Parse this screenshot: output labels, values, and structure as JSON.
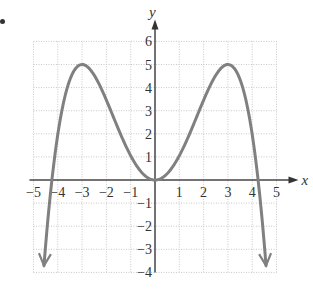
{
  "chart_data": {
    "type": "line",
    "title": "",
    "xlabel": "x",
    "ylabel": "y",
    "xlim": [
      -5,
      5
    ],
    "ylim": [
      -4,
      6
    ],
    "grid": true,
    "x_ticks": [
      -5,
      -4,
      -3,
      -2,
      -1,
      1,
      2,
      3,
      4,
      5
    ],
    "x_tick_labels": [
      "−5",
      "−4",
      "−3",
      "−2",
      "−1",
      "1",
      "2",
      "3",
      "4",
      "5"
    ],
    "y_ticks": [
      6,
      5,
      4,
      3,
      2,
      1,
      -1,
      -2,
      -3,
      -4
    ],
    "y_tick_labels": [
      "6",
      "5",
      "4",
      "3",
      "2",
      "1",
      "−1",
      "−2",
      "−3",
      "−4"
    ],
    "series": [
      {
        "name": "polynomial curve",
        "color": "#808080",
        "description": "Even quartic with local maxima at (-3,5) and (3,5), local minimum at (0,0), x-intercepts near ±4.24, arrows pointing down at both ends",
        "points": [
          {
            "x": -4.5,
            "y": -4
          },
          {
            "x": -4.24,
            "y": 0
          },
          {
            "x": -4,
            "y": 2.2
          },
          {
            "x": -3,
            "y": 5
          },
          {
            "x": -2,
            "y": 3.5
          },
          {
            "x": -1,
            "y": 1.2
          },
          {
            "x": 0,
            "y": 0
          },
          {
            "x": 1,
            "y": 1.2
          },
          {
            "x": 2,
            "y": 3.5
          },
          {
            "x": 3,
            "y": 5
          },
          {
            "x": 4,
            "y": 2.2
          },
          {
            "x": 4.24,
            "y": 0
          },
          {
            "x": 4.5,
            "y": -4
          }
        ],
        "end_arrows": true
      }
    ]
  }
}
